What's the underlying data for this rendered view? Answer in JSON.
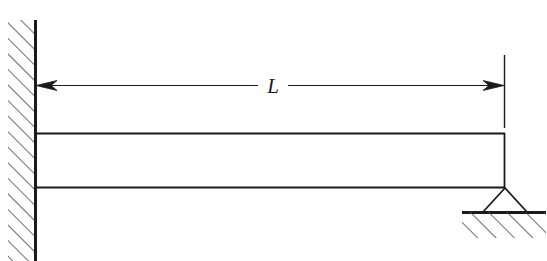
{
  "figure": {
    "type": "structural-beam-diagram",
    "background_color": "#ffffff",
    "line_color": "#1a1a1a"
  },
  "dimension": {
    "label": "L",
    "label_style": "italic-serif",
    "arrow_left": "arrowhead-left",
    "arrow_right": "arrowhead-right",
    "span_start_x": 35,
    "span_end_x": 505,
    "line_y": 85
  },
  "wall": {
    "name": "fixed-support-wall",
    "face_x": 35,
    "top_y": 20,
    "bottom_y": 261,
    "hatch_band_width": 27,
    "hatch_direction": "up-right",
    "hatch_spacing": 11
  },
  "beam": {
    "name": "beam-member",
    "left_x": 35,
    "right_x": 505,
    "top_y": 133,
    "bottom_y": 187,
    "depth": 54
  },
  "pin_support": {
    "name": "pin-support",
    "apex_x": 505,
    "apex_y": 187,
    "base_y": 212,
    "base_half_width": 22
  },
  "ground": {
    "name": "ground-line",
    "line_y": 212,
    "left_x": 462,
    "right_x": 546,
    "hatch_direction": "up-right",
    "hatch_spacing": 13,
    "hatch_depth": 26
  }
}
